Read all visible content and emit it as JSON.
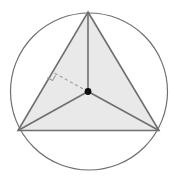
{
  "figure": {
    "canvas": {
      "width": 175,
      "height": 183,
      "background": "#ffffff"
    },
    "colors": {
      "stroke": "#6f6f6f",
      "circle_stroke": "#6f6f6f",
      "triangle_fill": "#e9e9e9",
      "radius_stroke": "#6f6f6f",
      "dashed_stroke": "#9a9a9a",
      "center_dot": "#0d0d0d",
      "right_angle_stroke": "#9a9a9a"
    },
    "circle": {
      "name": "circumscribed-circle",
      "cx": 89,
      "cy": 91.5,
      "r": 78.5,
      "stroke_width": 1.2,
      "fill": "none"
    },
    "triangle": {
      "name": "inscribed-equilateral-triangle",
      "points": "88,12 159,130.5 18,130.5",
      "vertices": [
        {
          "label": "apex",
          "x": 88,
          "y": 12
        },
        {
          "label": "right",
          "x": 159,
          "y": 130.5
        },
        {
          "label": "left",
          "x": 18,
          "y": 130.5
        }
      ],
      "stroke_width": 1.6
    },
    "center": {
      "name": "circumcenter",
      "x": 88,
      "y": 91.5,
      "dot_radius": 3.4
    },
    "radii": [
      {
        "name": "radius-to-apex",
        "x1": 88,
        "y1": 91.5,
        "x2": 88,
        "y2": 12
      },
      {
        "name": "radius-to-left-vertex",
        "x1": 88,
        "y1": 91.5,
        "x2": 18,
        "y2": 130.5
      },
      {
        "name": "radius-to-right-vertex",
        "x1": 88,
        "y1": 91.5,
        "x2": 159,
        "y2": 130.5
      }
    ],
    "apothem": {
      "name": "apothem-dashed-segment",
      "x1": 88,
      "y1": 91.5,
      "x2": 53.2,
      "y2": 72.5,
      "dash_pattern": "3.2,2.6",
      "stroke_width": 1.1
    },
    "right_angle_mark": {
      "name": "right-angle-marker",
      "points": "47.4,77.5 52.6,80.5 55.6,75.2",
      "stroke_width": 1.1
    }
  }
}
